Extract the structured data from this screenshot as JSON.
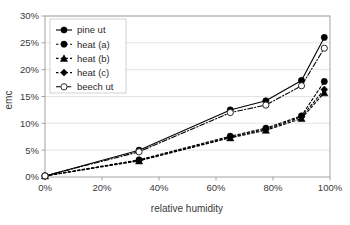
{
  "chart_data": {
    "type": "line",
    "title": "",
    "xlabel": "relative humidity",
    "ylabel": "emc",
    "xlim": [
      0,
      100
    ],
    "ylim": [
      0,
      30
    ],
    "grid": true,
    "grid_axis": "y",
    "legend_position": "top-left",
    "x_ticks": [
      "0%",
      "20%",
      "40%",
      "60%",
      "80%",
      "100%"
    ],
    "x_tick_values": [
      0,
      20,
      40,
      60,
      80,
      100
    ],
    "y_ticks": [
      "0%",
      "5%",
      "10%",
      "15%",
      "20%",
      "25%",
      "30%"
    ],
    "y_tick_values": [
      0,
      5,
      10,
      15,
      20,
      25,
      30
    ],
    "series": [
      {
        "name": "pine ut",
        "marker": "filled-circle",
        "line": "solid",
        "color": "#000000",
        "x": [
          0,
          33,
          65,
          77.5,
          90,
          98
        ],
        "values": [
          0.2,
          5.0,
          12.5,
          14.2,
          18.0,
          26.0
        ]
      },
      {
        "name": "heat (a)",
        "marker": "filled-circle",
        "line": "dashed",
        "color": "#000000",
        "x": [
          0,
          33,
          65,
          77.5,
          90,
          98
        ],
        "values": [
          0.2,
          3.2,
          7.6,
          9.1,
          11.4,
          17.8
        ]
      },
      {
        "name": "heat (b)",
        "marker": "filled-triangle",
        "line": "dashed",
        "color": "#000000",
        "x": [
          0,
          33,
          65,
          77.5,
          90,
          98
        ],
        "values": [
          0.2,
          3.0,
          7.3,
          8.7,
          10.9,
          15.7
        ]
      },
      {
        "name": "heat (c)",
        "marker": "filled-diamond",
        "line": "dashed",
        "color": "#000000",
        "x": [
          0,
          33,
          65,
          77.5,
          90,
          98
        ],
        "values": [
          0.2,
          3.1,
          7.4,
          8.9,
          11.2,
          16.3
        ]
      },
      {
        "name": "beech ut",
        "marker": "open-circle",
        "line": "dash-dot",
        "color": "#000000",
        "x": [
          0,
          33,
          65,
          77.5,
          90,
          98
        ],
        "values": [
          0.2,
          4.7,
          12.0,
          13.4,
          17.0,
          24.0
        ]
      }
    ]
  },
  "legend": {
    "items": [
      {
        "label": "pine ut"
      },
      {
        "label": "heat (a)"
      },
      {
        "label": "heat (b)"
      },
      {
        "label": "heat (c)"
      },
      {
        "label": "beech ut"
      }
    ]
  }
}
